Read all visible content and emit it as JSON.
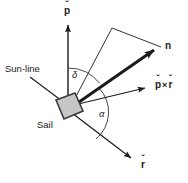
{
  "figure": {
    "background_color": "#ffffff",
    "line_color": "#1a1a1a",
    "sail_fill_color": "#c6c6c6",
    "sail_edge_color": "#3a3a3a",
    "width": 188,
    "height": 183
  },
  "labels": {
    "p_vector": "p",
    "p_vector_accent": "ˇ",
    "n_vector": "n",
    "p_cross_r_p": "p",
    "p_cross_r_symbol": "×",
    "p_cross_r_r": "r",
    "r_vector": "r",
    "r_vector_accent": "ˇ",
    "delta_angle": "δ",
    "alpha_angle": "α",
    "sun_line": "Sun-line",
    "sail": "Sail"
  },
  "geometry": {
    "origin": {
      "x": 68,
      "y": 108
    },
    "p_arrow_tip": {
      "x": 68,
      "y": 22
    },
    "n_arrow_tip": {
      "x": 161,
      "y": 47
    },
    "pxr_arrow_tip": {
      "x": 152,
      "y": 86
    },
    "r_arrow_tip": {
      "x": 137,
      "y": 163
    },
    "sun_line_start": {
      "x": 30,
      "y": 77
    },
    "wedge_apex": {
      "x": 112,
      "y": 28
    },
    "delta_arc_radius": 40,
    "alpha_arc_radius": 35
  }
}
